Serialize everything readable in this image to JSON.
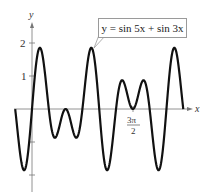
{
  "chart_data": {
    "type": "line",
    "title": "",
    "annotation": "y = sin 5x + sin 3x",
    "function": "sin(5x) + sin(3x)",
    "xlabel": "x",
    "ylabel": "y",
    "x_range": [
      -0.785,
      7.069
    ],
    "ylim": [
      -2.3,
      2.4
    ],
    "y_ticks": [
      -2,
      -1,
      1,
      2
    ],
    "y_tick_labels": {
      "1": "1",
      "2": "2"
    },
    "x_tick_labels": [
      {
        "value": 4.712,
        "label": "3π/2"
      }
    ],
    "grid": false,
    "series": [
      {
        "name": "y = sin 5x + sin 3x",
        "color": "#111111"
      }
    ]
  },
  "labels": {
    "y_axis": "y",
    "x_axis": "x",
    "tick_1": "1",
    "tick_2": "2",
    "tick_3pi2_num": "3π",
    "tick_3pi2_den": "2",
    "callout": "y = sin 5x + sin 3x"
  }
}
